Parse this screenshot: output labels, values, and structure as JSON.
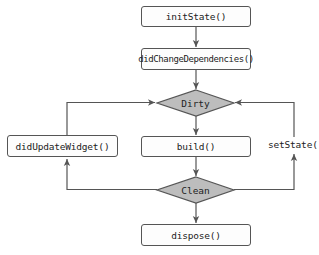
{
  "diagram": {
    "title": "",
    "type": "flowchart",
    "colors": {
      "background": "#ffffff",
      "box_fill": "#fdfdfd",
      "box_border": "#555555",
      "decision_fill": "#bdbdbd",
      "line": "#555555",
      "text": "#222222"
    },
    "nodes": {
      "init_state": {
        "label": "initState()",
        "shape": "rounded-rect"
      },
      "did_change_dependencies": {
        "label": "didChangeDependencies()",
        "shape": "rounded-rect"
      },
      "dirty": {
        "label": "Dirty",
        "shape": "diamond"
      },
      "did_update_widget": {
        "label": "didUpdateWidget()",
        "shape": "rounded-rect"
      },
      "build": {
        "label": "build()",
        "shape": "rounded-rect"
      },
      "clean": {
        "label": "Clean",
        "shape": "diamond"
      },
      "dispose": {
        "label": "dispose()",
        "shape": "rounded-rect"
      }
    },
    "edge_labels": {
      "set_state": "setState()"
    },
    "edges": [
      {
        "from": "initState()",
        "to": "didChangeDependencies()"
      },
      {
        "from": "didChangeDependencies()",
        "to": "Dirty"
      },
      {
        "from": "Dirty",
        "to": "build()"
      },
      {
        "from": "build()",
        "to": "Clean"
      },
      {
        "from": "Clean",
        "to": "dispose()"
      },
      {
        "from": "Clean",
        "to": "didUpdateWidget()"
      },
      {
        "from": "didUpdateWidget()",
        "to": "Dirty"
      },
      {
        "from": "Clean",
        "to": "Dirty",
        "label": "setState()"
      }
    ]
  }
}
